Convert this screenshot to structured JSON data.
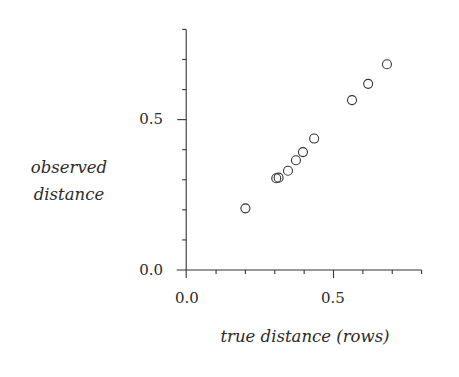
{
  "chart_data": {
    "type": "scatter",
    "title": "",
    "xlabel": "true distance (rows)",
    "ylabel": [
      "observed",
      "distance"
    ],
    "xlim": [
      0.0,
      0.8
    ],
    "ylim": [
      0.0,
      0.8
    ],
    "x_major_ticks": [
      0.0,
      0.5
    ],
    "x_major_tick_labels": [
      "0.0",
      "0.5"
    ],
    "x_minor_tick_step": 0.1,
    "y_major_ticks": [
      0.0,
      0.5
    ],
    "y_major_tick_labels": [
      "0.0",
      "0.5"
    ],
    "y_minor_tick_step": 0.1,
    "grid": false,
    "legend": null,
    "marker": "open-circle",
    "series": [
      {
        "name": "observations",
        "points": [
          {
            "x": 0.2,
            "y": 0.205
          },
          {
            "x": 0.305,
            "y": 0.305
          },
          {
            "x": 0.313,
            "y": 0.307
          },
          {
            "x": 0.345,
            "y": 0.33
          },
          {
            "x": 0.372,
            "y": 0.365
          },
          {
            "x": 0.396,
            "y": 0.392
          },
          {
            "x": 0.434,
            "y": 0.437
          },
          {
            "x": 0.563,
            "y": 0.565
          },
          {
            "x": 0.618,
            "y": 0.619
          },
          {
            "x": 0.682,
            "y": 0.684
          }
        ]
      }
    ]
  }
}
